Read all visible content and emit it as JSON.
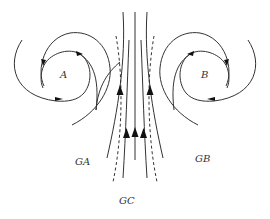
{
  "diagram": {
    "type": "flow-field",
    "labels": {
      "vortex_a": "A",
      "vortex_b": "B",
      "region_ga": "GA",
      "region_gb": "GB",
      "region_gc": "GC"
    },
    "colors": {
      "stroke": "#333333",
      "arrowhead": "#111111",
      "background": "#ffffff"
    },
    "elements": [
      {
        "id": "vortex-a",
        "kind": "spiral",
        "label": "A"
      },
      {
        "id": "vortex-b",
        "kind": "spiral",
        "label": "B"
      },
      {
        "id": "central-jet",
        "kind": "upward-streamlines",
        "solid_lines": 5,
        "dashed_boundaries": 2,
        "arrows": 3
      }
    ]
  }
}
